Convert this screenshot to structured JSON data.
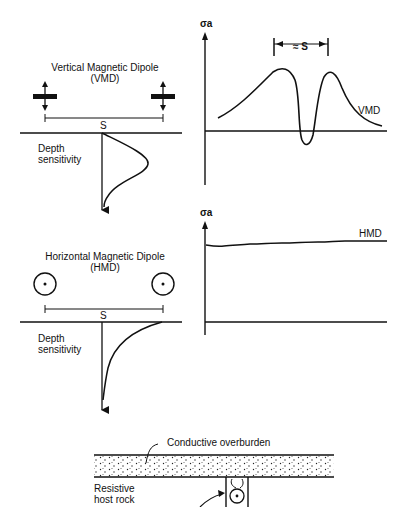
{
  "vmd": {
    "title_line1": "Vertical Magnetic Dipole",
    "title_line2": "(VMD)",
    "spacing_label": "S",
    "depth_label_line1": "Depth",
    "depth_label_line2": "sensitivity",
    "plot_axis_label": "σa",
    "plot_curve_label": "VMD",
    "peak_separation_label": "≈ S"
  },
  "hmd": {
    "title_line1": "Horizontal Magnetic Dipole",
    "title_line2": "(HMD)",
    "spacing_label": "S",
    "depth_label_line1": "Depth",
    "depth_label_line2": "sensitivity",
    "plot_axis_label": "σa",
    "plot_curve_label": "HMD"
  },
  "section": {
    "overburden_label": "Conductive overburden",
    "host_rock_line1": "Resistive",
    "host_rock_line2": "host rock"
  },
  "colors": {
    "ink": "#111111",
    "background": "#ffffff"
  }
}
